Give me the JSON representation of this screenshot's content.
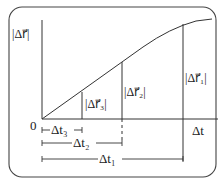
{
  "diagram": {
    "y_axis_label": "|Δr⃗|",
    "x_axis_label": "Δt",
    "origin_label": "0",
    "segments": [
      {
        "name": "r1",
        "label": "|Δr⃗₁|",
        "t_label": "Δt₁"
      },
      {
        "name": "r2",
        "label": "|Δr⃗₂|",
        "t_label": "Δt₂"
      },
      {
        "name": "r3",
        "label": "|Δr⃗₃|",
        "t_label": "Δt₃"
      }
    ],
    "colors": {
      "line": "#333333",
      "frame": "#444444"
    }
  }
}
